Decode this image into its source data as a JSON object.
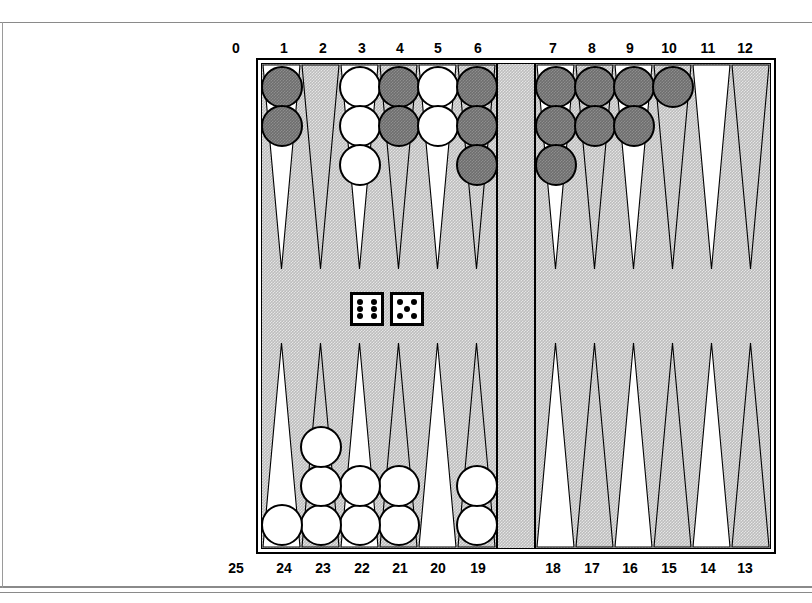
{
  "game": {
    "name": "backgammon-board",
    "title": "Backgammon position diagram"
  },
  "labels": {
    "top": [
      "0",
      "1",
      "2",
      "3",
      "4",
      "5",
      "6",
      "7",
      "8",
      "9",
      "10",
      "11",
      "12"
    ],
    "bottom": [
      "25",
      "24",
      "23",
      "22",
      "21",
      "20",
      "19",
      "18",
      "17",
      "16",
      "15",
      "14",
      "13"
    ]
  },
  "colors": {
    "dark_checker": "#6e6e6e",
    "light_checker": "#ffffff",
    "board_background": "#bdbdbd",
    "point_light": "#ffffff",
    "outline": "#000000"
  },
  "dice": [
    {
      "name": "die-left",
      "value": 6
    },
    {
      "name": "die-right",
      "value": 5
    }
  ],
  "points": [
    {
      "label": "1",
      "quadrant": "top-left",
      "slot": 0,
      "checkers": 2,
      "color": "dark"
    },
    {
      "label": "2",
      "quadrant": "top-left",
      "slot": 1,
      "checkers": 0,
      "color": null
    },
    {
      "label": "3",
      "quadrant": "top-left",
      "slot": 2,
      "checkers": 3,
      "color": "light"
    },
    {
      "label": "4",
      "quadrant": "top-left",
      "slot": 3,
      "checkers": 2,
      "color": "dark"
    },
    {
      "label": "5",
      "quadrant": "top-left",
      "slot": 4,
      "checkers": 2,
      "color": "light"
    },
    {
      "label": "6",
      "quadrant": "top-left",
      "slot": 5,
      "checkers": 3,
      "color": "dark"
    },
    {
      "label": "7",
      "quadrant": "top-right",
      "slot": 0,
      "checkers": 3,
      "color": "dark"
    },
    {
      "label": "8",
      "quadrant": "top-right",
      "slot": 1,
      "checkers": 2,
      "color": "dark"
    },
    {
      "label": "9",
      "quadrant": "top-right",
      "slot": 2,
      "checkers": 2,
      "color": "dark"
    },
    {
      "label": "10",
      "quadrant": "top-right",
      "slot": 3,
      "checkers": 1,
      "color": "dark"
    },
    {
      "label": "11",
      "quadrant": "top-right",
      "slot": 4,
      "checkers": 0,
      "color": null
    },
    {
      "label": "12",
      "quadrant": "top-right",
      "slot": 5,
      "checkers": 0,
      "color": null
    },
    {
      "label": "13",
      "quadrant": "bottom-right",
      "slot": 5,
      "checkers": 0,
      "color": null
    },
    {
      "label": "14",
      "quadrant": "bottom-right",
      "slot": 4,
      "checkers": 0,
      "color": null
    },
    {
      "label": "15",
      "quadrant": "bottom-right",
      "slot": 3,
      "checkers": 0,
      "color": null
    },
    {
      "label": "16",
      "quadrant": "bottom-right",
      "slot": 2,
      "checkers": 0,
      "color": null
    },
    {
      "label": "17",
      "quadrant": "bottom-right",
      "slot": 1,
      "checkers": 0,
      "color": null
    },
    {
      "label": "18",
      "quadrant": "bottom-right",
      "slot": 0,
      "checkers": 0,
      "color": null
    },
    {
      "label": "19",
      "quadrant": "bottom-left",
      "slot": 5,
      "checkers": 2,
      "color": "light"
    },
    {
      "label": "20",
      "quadrant": "bottom-left",
      "slot": 4,
      "checkers": 0,
      "color": null
    },
    {
      "label": "21",
      "quadrant": "bottom-left",
      "slot": 3,
      "checkers": 2,
      "color": "light"
    },
    {
      "label": "22",
      "quadrant": "bottom-left",
      "slot": 2,
      "checkers": 2,
      "color": "light"
    },
    {
      "label": "23",
      "quadrant": "bottom-left",
      "slot": 1,
      "checkers": 3,
      "color": "light"
    },
    {
      "label": "24",
      "quadrant": "bottom-left",
      "slot": 0,
      "checkers": 1,
      "color": "light"
    }
  ],
  "bar": {
    "dark_checkers": 0,
    "light_checkers": 0
  }
}
